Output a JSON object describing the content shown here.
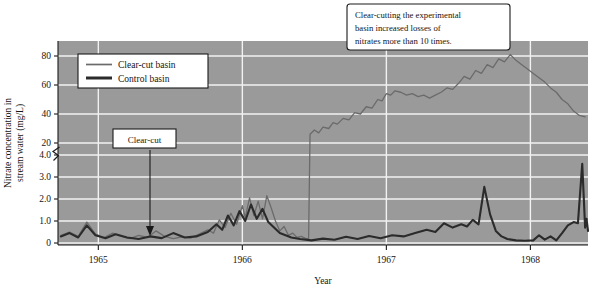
{
  "chart_data": {
    "type": "line",
    "title": "",
    "xlabel": "Year",
    "ylabel_line1": "Nitrate concentration in",
    "ylabel_line2": "stream water (mg/L)",
    "x_ticks": [
      "1965",
      "1966",
      "1967",
      "1968"
    ],
    "x_tick_values": [
      1965,
      1966,
      1967,
      1968
    ],
    "xlim": [
      1964.72,
      1968.4
    ],
    "y_ticks_lower": [
      "0",
      "1.0",
      "2.0",
      "3.0",
      "4.0"
    ],
    "y_ticks_upper": [
      "20",
      "40",
      "60",
      "80"
    ],
    "y_axis_break": true,
    "y_axis_break_note": "Axis is broken between 4.0 and 20",
    "ylim_lower": [
      0,
      4
    ],
    "ylim_upper": [
      10,
      90
    ],
    "grid": true,
    "grid_color": "#f2f2f2",
    "plot_background": "#9a9a9a",
    "legend_position": "upper-left-inside",
    "series": [
      {
        "name": "Clear-cut basin",
        "color": "#6b6b6b",
        "width": 1.3,
        "points": [
          [
            1964.74,
            0.35
          ],
          [
            1964.8,
            0.5
          ],
          [
            1964.86,
            0.3
          ],
          [
            1964.92,
            0.95
          ],
          [
            1964.98,
            0.4
          ],
          [
            1965.04,
            0.25
          ],
          [
            1965.1,
            0.45
          ],
          [
            1965.16,
            0.3
          ],
          [
            1965.22,
            0.2
          ],
          [
            1965.28,
            0.35
          ],
          [
            1965.34,
            0.25
          ],
          [
            1965.4,
            0.55
          ],
          [
            1965.46,
            0.3
          ],
          [
            1965.52,
            0.2
          ],
          [
            1965.58,
            0.28
          ],
          [
            1965.64,
            0.22
          ],
          [
            1965.7,
            0.4
          ],
          [
            1965.76,
            0.6
          ],
          [
            1965.8,
            0.45
          ],
          [
            1965.84,
            1.05
          ],
          [
            1965.88,
            0.7
          ],
          [
            1965.92,
            1.35
          ],
          [
            1965.96,
            0.85
          ],
          [
            1966.0,
            1.7
          ],
          [
            1966.02,
            1.15
          ],
          [
            1966.05,
            2.05
          ],
          [
            1966.08,
            1.25
          ],
          [
            1966.11,
            1.9
          ],
          [
            1966.14,
            1.1
          ],
          [
            1966.17,
            2.15
          ],
          [
            1966.2,
            1.6
          ],
          [
            1966.23,
            1.0
          ],
          [
            1966.26,
            0.55
          ],
          [
            1966.29,
            0.75
          ],
          [
            1966.32,
            0.35
          ],
          [
            1966.35,
            0.45
          ],
          [
            1966.38,
            0.25
          ],
          [
            1966.41,
            0.3
          ],
          [
            1966.44,
            0.2
          ],
          [
            1966.46,
            0.2
          ],
          [
            1966.47,
            26
          ],
          [
            1966.5,
            29
          ],
          [
            1966.53,
            27
          ],
          [
            1966.56,
            31
          ],
          [
            1966.6,
            30
          ],
          [
            1966.63,
            34
          ],
          [
            1966.66,
            33
          ],
          [
            1966.7,
            37
          ],
          [
            1966.74,
            36
          ],
          [
            1966.78,
            41
          ],
          [
            1966.82,
            40
          ],
          [
            1966.86,
            45
          ],
          [
            1966.9,
            44
          ],
          [
            1966.94,
            50
          ],
          [
            1966.97,
            49
          ],
          [
            1967.0,
            54
          ],
          [
            1967.03,
            53
          ],
          [
            1967.06,
            56
          ],
          [
            1967.1,
            55
          ],
          [
            1967.14,
            53
          ],
          [
            1967.18,
            54
          ],
          [
            1967.22,
            52
          ],
          [
            1967.26,
            53
          ],
          [
            1967.3,
            51
          ],
          [
            1967.34,
            53
          ],
          [
            1967.38,
            55
          ],
          [
            1967.42,
            58
          ],
          [
            1967.46,
            57
          ],
          [
            1967.5,
            61
          ],
          [
            1967.54,
            66
          ],
          [
            1967.58,
            64
          ],
          [
            1967.62,
            70
          ],
          [
            1967.66,
            68
          ],
          [
            1967.7,
            74
          ],
          [
            1967.74,
            72
          ],
          [
            1967.78,
            78
          ],
          [
            1967.82,
            76
          ],
          [
            1967.86,
            81
          ],
          [
            1967.9,
            77
          ],
          [
            1967.94,
            74
          ],
          [
            1967.98,
            71
          ],
          [
            1968.02,
            68
          ],
          [
            1968.06,
            65
          ],
          [
            1968.1,
            62
          ],
          [
            1968.14,
            58
          ],
          [
            1968.18,
            55
          ],
          [
            1968.22,
            50
          ],
          [
            1968.26,
            47
          ],
          [
            1968.3,
            42
          ],
          [
            1968.34,
            39
          ],
          [
            1968.38,
            38
          ]
        ]
      },
      {
        "name": "Control basin",
        "color": "#2b2b2b",
        "width": 2.1,
        "points": [
          [
            1964.74,
            0.3
          ],
          [
            1964.8,
            0.45
          ],
          [
            1964.86,
            0.25
          ],
          [
            1964.92,
            0.8
          ],
          [
            1964.98,
            0.35
          ],
          [
            1965.05,
            0.22
          ],
          [
            1965.12,
            0.4
          ],
          [
            1965.2,
            0.25
          ],
          [
            1965.28,
            0.18
          ],
          [
            1965.36,
            0.3
          ],
          [
            1965.44,
            0.22
          ],
          [
            1965.52,
            0.45
          ],
          [
            1965.6,
            0.25
          ],
          [
            1965.68,
            0.3
          ],
          [
            1965.76,
            0.5
          ],
          [
            1965.82,
            0.85
          ],
          [
            1965.86,
            0.6
          ],
          [
            1965.9,
            1.25
          ],
          [
            1965.94,
            0.8
          ],
          [
            1965.98,
            1.45
          ],
          [
            1966.02,
            1.0
          ],
          [
            1966.06,
            1.75
          ],
          [
            1966.1,
            1.1
          ],
          [
            1966.14,
            1.55
          ],
          [
            1966.18,
            0.95
          ],
          [
            1966.22,
            0.7
          ],
          [
            1966.26,
            0.45
          ],
          [
            1966.3,
            0.35
          ],
          [
            1966.34,
            0.25
          ],
          [
            1966.4,
            0.18
          ],
          [
            1966.48,
            0.12
          ],
          [
            1966.56,
            0.2
          ],
          [
            1966.64,
            0.15
          ],
          [
            1966.72,
            0.28
          ],
          [
            1966.8,
            0.18
          ],
          [
            1966.88,
            0.32
          ],
          [
            1966.96,
            0.22
          ],
          [
            1967.04,
            0.35
          ],
          [
            1967.12,
            0.3
          ],
          [
            1967.2,
            0.45
          ],
          [
            1967.28,
            0.6
          ],
          [
            1967.34,
            0.5
          ],
          [
            1967.4,
            0.9
          ],
          [
            1967.46,
            0.7
          ],
          [
            1967.52,
            0.85
          ],
          [
            1967.56,
            0.75
          ],
          [
            1967.6,
            1.05
          ],
          [
            1967.64,
            0.85
          ],
          [
            1967.68,
            2.55
          ],
          [
            1967.72,
            1.3
          ],
          [
            1967.76,
            0.55
          ],
          [
            1967.8,
            0.3
          ],
          [
            1967.84,
            0.18
          ],
          [
            1967.9,
            0.12
          ],
          [
            1967.96,
            0.1
          ],
          [
            1968.02,
            0.12
          ],
          [
            1968.06,
            0.35
          ],
          [
            1968.1,
            0.15
          ],
          [
            1968.14,
            0.3
          ],
          [
            1968.18,
            0.12
          ],
          [
            1968.22,
            0.45
          ],
          [
            1968.26,
            0.8
          ],
          [
            1968.3,
            0.95
          ],
          [
            1968.33,
            0.9
          ],
          [
            1968.36,
            3.6
          ],
          [
            1968.38,
            0.7
          ],
          [
            1968.39,
            1.1
          ],
          [
            1968.4,
            0.55
          ]
        ]
      }
    ],
    "annotations": [
      {
        "name": "clear-cut-event",
        "text": "Clear-cut",
        "arrow": true,
        "arrow_target_value": 0.45
      },
      {
        "name": "conclusion-callout",
        "lines": [
          "Clear-cutting the experimental",
          "basin increased losses of",
          "nitrates more than 10 times."
        ]
      }
    ]
  },
  "legend": {
    "items": [
      {
        "label": "Clear-cut basin",
        "swatch": "thin-gray-line"
      },
      {
        "label": "Control basin",
        "swatch": "thick-dark-line"
      }
    ]
  }
}
